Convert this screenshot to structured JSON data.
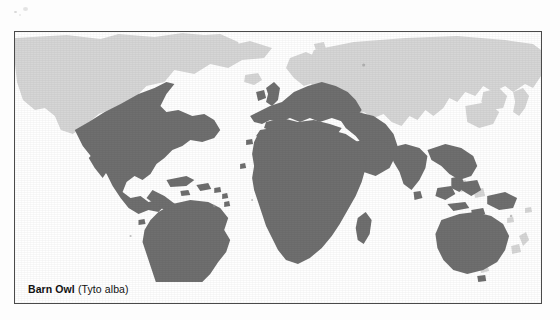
{
  "figure": {
    "kind": "species-distribution-map",
    "caption": {
      "common_name": "Barn Owl",
      "scientific_name": "(Tyto alba)"
    }
  },
  "colors": {
    "range_fill": "#6f6f6f",
    "land_fill": "#d6d6d6",
    "ocean_fill": "#ffffff",
    "border": "#4a4a4a",
    "caption_text": "#111111",
    "page_background": "#fdfdfd"
  },
  "map": {
    "projection_note": "world map, equirectangular-like",
    "legend_implied": {
      "dark_shading": "breeding / resident range",
      "light_shading": "land outside range"
    },
    "regions_in_range": [
      "United States",
      "Mexico",
      "Central America",
      "Caribbean islands",
      "South America",
      "Western Europe",
      "British Isles",
      "Mediterranean basin",
      "North Africa coast",
      "Sub-Saharan Africa",
      "Madagascar",
      "Arabian Peninsula",
      "India",
      "Southeast Asia",
      "Indonesia",
      "New Guinea",
      "Australia"
    ],
    "regions_out_of_range": [
      "Canada",
      "Alaska",
      "Greenland",
      "Scandinavia",
      "Siberia",
      "Northern Asia",
      "China",
      "Japan",
      "Sahara Desert",
      "Amazon Basin",
      "New Zealand"
    ]
  }
}
